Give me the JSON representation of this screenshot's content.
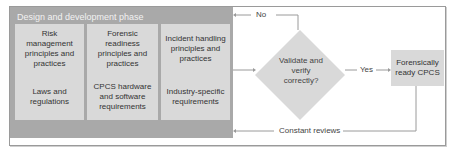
{
  "phase": {
    "title": "Design and development phase",
    "cells": [
      "Risk management principles and practices",
      "Forensic readiness principles and practices",
      "Incident handling principles and practices",
      "Laws and regulations",
      "CPCS hardware and software requirements",
      "Industry-specific requirements"
    ]
  },
  "decision": {
    "text": "Validate and verify correctly?"
  },
  "result": {
    "text": "Forensically ready CPCS"
  },
  "edges": {
    "no": "No",
    "yes": "Yes",
    "review": "Constant reviews"
  },
  "colors": {
    "phase_bg": "#a9a9a9",
    "cell_bg": "#d9d9d9",
    "line": "#9a9a9a"
  }
}
